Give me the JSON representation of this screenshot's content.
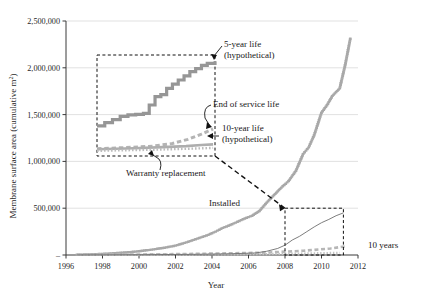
{
  "chart_data": {
    "type": "line",
    "title": "",
    "xlabel": "Year",
    "ylabel": "Membrane surface area (cumulative m²)",
    "xlim": [
      1996,
      2012
    ],
    "ylim": [
      0,
      2500000
    ],
    "xticks": [
      "1996",
      "1998",
      "2000",
      "2002",
      "2004",
      "2006",
      "2008",
      "2010",
      "2012"
    ],
    "yticks": [
      "–",
      "500,000",
      "1,000,000",
      "1,500,000",
      "2,000,000",
      "2,500,000"
    ],
    "ytick_values": [
      0,
      500000,
      1000000,
      1500000,
      2000000,
      2500000
    ],
    "grid": "horizontal",
    "legend_position": "none",
    "series": [
      {
        "name": "Installed",
        "style": "gray-marker-dots",
        "color": "#a8a8a8",
        "x": [
          1996.6,
          1997.2,
          1997.8,
          1998.4,
          1999.0,
          1999.6,
          2000.2,
          2000.8,
          2001.4,
          2002.0,
          2002.6,
          2003.2,
          2003.8,
          2004.2,
          2004.6,
          2005.0,
          2005.4,
          2005.8,
          2006.2,
          2006.6,
          2007.0,
          2007.4,
          2007.8,
          2008.2,
          2008.6,
          2009.0,
          2009.3,
          2009.6,
          2010.0,
          2010.3,
          2010.6,
          2011.0,
          2011.3,
          2011.6
        ],
        "y": [
          3000,
          6000,
          10000,
          16000,
          24000,
          32000,
          45000,
          60000,
          78000,
          100000,
          135000,
          175000,
          215000,
          250000,
          290000,
          320000,
          355000,
          390000,
          420000,
          470000,
          560000,
          640000,
          720000,
          790000,
          900000,
          1080000,
          1150000,
          1280000,
          1520000,
          1600000,
          1700000,
          1780000,
          2030000,
          2330000
        ]
      },
      {
        "name": "End of service life",
        "style": "gray-dashed",
        "color": "#b6b6b6",
        "x": [
          1996.6,
          1999,
          2001,
          2003,
          2005,
          2007,
          2009,
          2010.5,
          2011.4
        ],
        "y": [
          2000,
          4000,
          7000,
          12000,
          18000,
          26000,
          45000,
          70000,
          95000
        ]
      },
      {
        "name": "Warranty replacement",
        "style": "gray-dotted",
        "color": "#c2c2c2",
        "x": [
          1996.6,
          1999,
          2001,
          2003,
          2005,
          2007,
          2009,
          2011
        ],
        "y": [
          1000,
          2000,
          3500,
          5000,
          7000,
          10000,
          16000,
          24000
        ]
      },
      {
        "name": "10-year life (hypothetical)",
        "style": "thin-dark-line",
        "color": "#6e6e6e",
        "x": [
          1996.6,
          2000,
          2003,
          2005,
          2006.4,
          2007.0,
          2007.6,
          2008.0,
          2008.4,
          2008.8,
          2009.2,
          2009.6,
          2010.0,
          2010.4,
          2010.8,
          2011.2
        ],
        "y": [
          1000,
          3000,
          7000,
          13000,
          22000,
          40000,
          70000,
          105000,
          160000,
          200000,
          250000,
          300000,
          345000,
          380000,
          420000,
          450000
        ]
      }
    ],
    "inset": {
      "label": "magnified view of 1996.6–2002.7",
      "x_range": [
        1996.6,
        2002.7
      ],
      "y_range": [
        1110000,
        2080000
      ],
      "curves": [
        {
          "name": "5-year life (hypothetical)",
          "style": "thick-gray-staircase",
          "color": "#969696",
          "x": [
            1996.6,
            1997.0,
            1997.4,
            1997.8,
            1998.2,
            1998.6,
            1999.0,
            1999.3,
            1999.6,
            1999.9,
            2000.2,
            2000.5,
            2000.8,
            2001.1,
            2001.4,
            2001.7,
            2002.0,
            2002.3,
            2002.7
          ],
          "y": [
            1400000,
            1430000,
            1460000,
            1490000,
            1505000,
            1510000,
            1520000,
            1600000,
            1680000,
            1700000,
            1760000,
            1800000,
            1840000,
            1880000,
            1920000,
            1950000,
            1980000,
            2000000,
            2020000
          ]
        },
        {
          "name": "End of service life",
          "style": "gray-dashed",
          "color": "#b4b4b4",
          "x": [
            1996.6,
            1998,
            1999.5,
            2000.5,
            2001.3,
            2002.0,
            2002.6
          ],
          "y": [
            1180000,
            1190000,
            1205000,
            1230000,
            1270000,
            1320000,
            1370000
          ]
        },
        {
          "name": "10-year life (hypothetical)",
          "style": "medium-gray-line",
          "color": "#aeaeae",
          "x": [
            1996.6,
            1998.5,
            2000,
            2001.2,
            2002.0,
            2002.6
          ],
          "y": [
            1175000,
            1185000,
            1195000,
            1205000,
            1215000,
            1222000
          ]
        },
        {
          "name": "Warranty replacement",
          "style": "gray-dotted",
          "color": "#bcbcbc",
          "x": [
            1996.6,
            1998,
            1999.5,
            2001,
            2002.2,
            2002.6
          ],
          "y": [
            1160000,
            1165000,
            1170000,
            1178000,
            1185000,
            1188000
          ]
        }
      ]
    },
    "source_box": {
      "x_range": [
        2008.0,
        2011.2
      ],
      "y_range": [
        0,
        500000
      ]
    },
    "annotations": [
      {
        "name": "five-year-life",
        "lines": [
          "5-year life",
          "(hypothetical)"
        ],
        "x": 224,
        "y": 47
      },
      {
        "name": "end-of-service-life",
        "lines": [
          "End of service life"
        ],
        "x": 213,
        "y": 107
      },
      {
        "name": "ten-year-life",
        "lines": [
          "10-year life",
          "(hypothetical)"
        ],
        "x": 222,
        "y": 131
      },
      {
        "name": "warranty-replacement",
        "lines": [
          "Warranty replacement"
        ],
        "x": 126,
        "y": 176
      },
      {
        "name": "installed",
        "lines": [
          "Installed"
        ],
        "x": 209,
        "y": 206
      },
      {
        "name": "ten-years",
        "lines": [
          "10 years"
        ],
        "x": 368,
        "y": 248
      }
    ]
  },
  "colors": {
    "background": "#ffffff",
    "axis": "#3a3a3a",
    "grid": "#d9d9d9",
    "installed": "#a8a8a8",
    "five_year": "#969696",
    "end_of_service": "#b4b4b4",
    "ten_year": "#6e6e6e",
    "annotation_line": "#111111"
  }
}
